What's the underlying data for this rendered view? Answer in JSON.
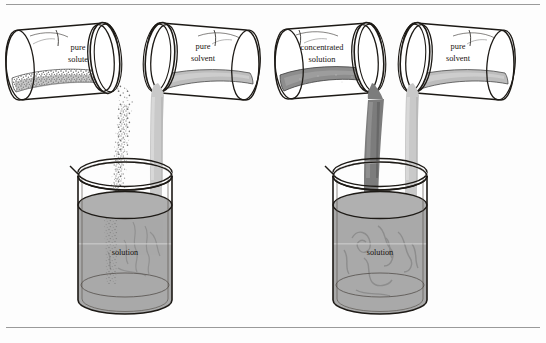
{
  "figure": {
    "rules": {
      "top_y": 4,
      "bottom_y": 327
    },
    "colors": {
      "ink": "#17130f",
      "paper": "#fdfdfd",
      "solution_fill": "#a9a9a9",
      "solvent_fill": "#bdbdbd",
      "solvent_stream": "#c9c9c9",
      "concentrated_fill": "#8d8d8d",
      "concentrated_stream": "#7c7c7c",
      "solute_grain": "#6f6f6f",
      "swirl": "#8a8a8a",
      "glass_line": "#1d1a16"
    }
  },
  "panels": [
    {
      "id": "panel-left",
      "name": "dissolve-solute-in-solvent",
      "jars": [
        {
          "id": "jar-pure-solute",
          "label_line1": "pure",
          "label_line2": "solute",
          "contents": "granular solid",
          "pour": "solute-stream",
          "facing": "right"
        },
        {
          "id": "jar-pure-solvent-left",
          "label_line1": "pure",
          "label_line2": "solvent",
          "contents": "liquid",
          "pour": "solvent-stream",
          "facing": "left"
        }
      ],
      "beaker": {
        "id": "beaker-left",
        "label": "solution"
      }
    },
    {
      "id": "panel-right",
      "name": "dilute-concentrated-solution",
      "jars": [
        {
          "id": "jar-concentrated-solution",
          "label_line1": "concentrated",
          "label_line2": "solution",
          "contents": "dark liquid",
          "pour": "concentrated-stream",
          "facing": "right"
        },
        {
          "id": "jar-pure-solvent-right",
          "label_line1": "pure",
          "label_line2": "solvent",
          "contents": "liquid",
          "pour": "solvent-stream",
          "facing": "left"
        }
      ],
      "beaker": {
        "id": "beaker-right",
        "label": "solution"
      }
    }
  ],
  "labels": {
    "pure_solute_1": "pure",
    "pure_solute_2": "solute",
    "pure_solvent_a1": "pure",
    "pure_solvent_a2": "solvent",
    "concentrated_1": "concentrated",
    "concentrated_2": "solution",
    "pure_solvent_b1": "pure",
    "pure_solvent_b2": "solvent",
    "beaker_left": "solution",
    "beaker_right": "solution"
  }
}
